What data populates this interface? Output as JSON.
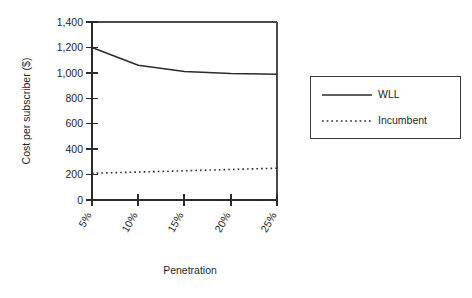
{
  "chart_data": {
    "type": "line",
    "title": "",
    "xlabel": "Penetration",
    "ylabel": "Cost per subscriber ($)",
    "x": [
      5,
      10,
      15,
      20,
      25
    ],
    "categories": [
      "5%",
      "10%",
      "15%",
      "20%",
      "25%"
    ],
    "xtick_labels": [
      "5%",
      "10%",
      "15%",
      "20%",
      "25%"
    ],
    "ytick_labels": [
      "0",
      "200",
      "400",
      "600",
      "800",
      "1,000",
      "1,200",
      "1,400"
    ],
    "ytick_values": [
      0,
      200,
      400,
      600,
      800,
      1000,
      1200,
      1400
    ],
    "ylim": [
      0,
      1400
    ],
    "xlim": [
      5,
      25
    ],
    "grid": false,
    "legend_position": "right-outside",
    "series": [
      {
        "name": "WLL",
        "style": "solid",
        "color": "#2b2b2b",
        "values": [
          1200,
          1060,
          1010,
          995,
          990
        ]
      },
      {
        "name": "Incumbent",
        "style": "dotted",
        "color": "#2b2b2b",
        "values": [
          210,
          220,
          230,
          240,
          250
        ]
      }
    ]
  },
  "legend": {
    "entries": [
      {
        "label": "WLL",
        "style": "solid"
      },
      {
        "label": "Incumbent",
        "style": "dotted"
      }
    ]
  }
}
